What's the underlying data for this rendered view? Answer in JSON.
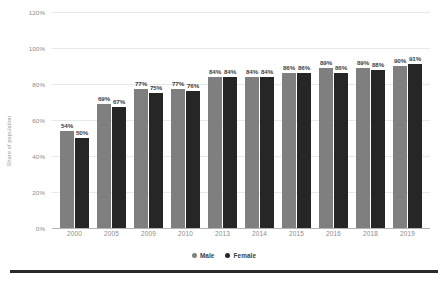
{
  "chart_data": {
    "type": "bar",
    "title": "",
    "subtitle": "",
    "xlabel": "",
    "ylabel": "Share of population",
    "categories": [
      "2000",
      "2005",
      "2009",
      "2010",
      "2013",
      "2014",
      "2015",
      "2016",
      "2018",
      "2019"
    ],
    "series": [
      {
        "name": "Male",
        "color": "#7f7f7f",
        "values": [
          54,
          69,
          77,
          77,
          84,
          84,
          86,
          89,
          89,
          90
        ],
        "value_labels": [
          "54%",
          "69%",
          "77%",
          "77%",
          "84%",
          "84%",
          "86%",
          "89%",
          "89%",
          "90%"
        ]
      },
      {
        "name": "Female",
        "color": "#262626",
        "values": [
          50,
          67,
          75,
          76,
          84,
          84,
          86,
          86,
          88,
          91
        ],
        "value_labels": [
          "50%",
          "67%",
          "75%",
          "76%",
          "84%",
          "84%",
          "86%",
          "86%",
          "88%",
          "91%"
        ]
      }
    ],
    "ylim": [
      0,
      120
    ],
    "y_ticks": [
      0,
      20,
      40,
      60,
      80,
      100,
      120
    ],
    "y_tick_labels": [
      "0%",
      "20%",
      "40%",
      "60%",
      "80%",
      "100%",
      "120%"
    ],
    "grid": true,
    "grid_axis": "y",
    "legend_position": "bottom"
  },
  "legend": {
    "items": [
      {
        "label": "Male",
        "color": "#7f7f7f"
      },
      {
        "label": "Female",
        "color": "#262626"
      }
    ]
  }
}
